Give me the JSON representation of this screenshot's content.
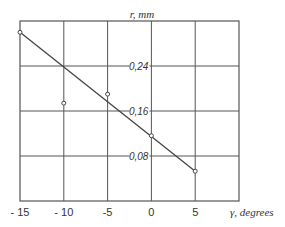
{
  "chart_data": {
    "type": "line",
    "title": "",
    "xlabel": "γ, degrees",
    "ylabel": "r, mm",
    "x_ticks": [
      "- 15",
      "- 10",
      "-5",
      "0",
      "5"
    ],
    "y_ticks": [
      "0,08",
      "0,16",
      "0,24"
    ],
    "xlim": [
      -15,
      10
    ],
    "ylim": [
      0,
      0.32
    ],
    "grid": true,
    "legend": null,
    "series": [
      {
        "name": "measured",
        "style": "markers",
        "x": [
          -15,
          -10,
          -5,
          0,
          5
        ],
        "y": [
          0.3,
          0.174,
          0.19,
          0.116,
          0.053
        ]
      },
      {
        "name": "fit",
        "style": "line",
        "x": [
          -15,
          5
        ],
        "y": [
          0.3,
          0.053
        ]
      }
    ]
  },
  "colors": {
    "grid": "#555555",
    "line": "#444444",
    "text": "#333333"
  }
}
